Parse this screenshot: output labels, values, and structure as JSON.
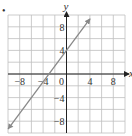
{
  "figure": {
    "marker": "•"
  },
  "chart_data": {
    "type": "line",
    "title": "",
    "xlabel": "x",
    "ylabel": "y",
    "xlim": [
      -10,
      10
    ],
    "ylim": [
      -10,
      10
    ],
    "grid": true,
    "grid_step": 2,
    "x_ticks": [
      -8,
      -4,
      0,
      4,
      8
    ],
    "y_ticks": [
      8,
      4,
      -4,
      -8
    ],
    "x_tick_labels": [
      "-8",
      "-4",
      "0",
      "4",
      "8"
    ],
    "y_tick_labels": [
      "8",
      "4",
      "-4",
      "-8"
    ],
    "series": [
      {
        "name": "line",
        "equation": "y = (4/3)x + 4",
        "x": [
          -10,
          4
        ],
        "y": [
          -9.33,
          9.33
        ],
        "color": "#888888",
        "arrows": "both"
      }
    ],
    "intercepts": {
      "x": -3,
      "y": 4
    }
  }
}
